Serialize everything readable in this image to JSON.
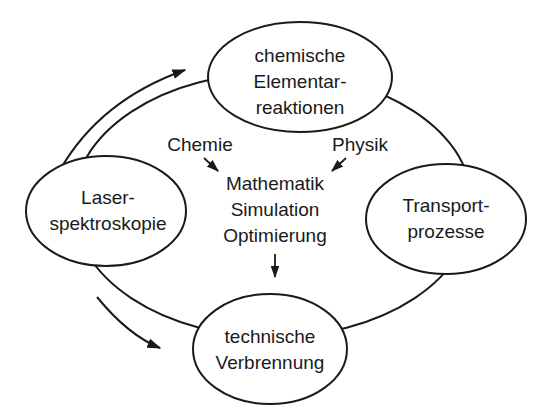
{
  "nodes": {
    "top": {
      "line1": "chemische",
      "line2": "Elementar-",
      "line3": "reaktionen"
    },
    "left": {
      "line1": "Laser-",
      "line2": "spektroskopie"
    },
    "right": {
      "line1": "Transport-",
      "line2": "prozesse"
    },
    "bottom": {
      "line1": "technische",
      "line2": "Verbrennung"
    }
  },
  "center": {
    "input_left": "Chemie",
    "input_right": "Physik",
    "line1": "Mathematik",
    "line2": "Simulation",
    "line3": "Optimierung"
  },
  "colors": {
    "stroke": "#1a1a1a",
    "background": "#ffffff"
  }
}
